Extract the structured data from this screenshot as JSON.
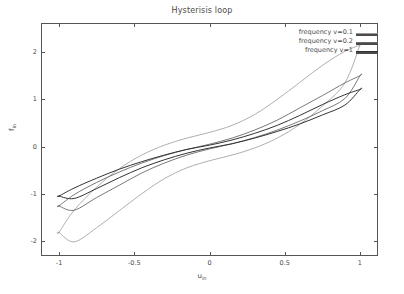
{
  "chart_data": {
    "type": "line",
    "title": "Hysterisis loop",
    "xlabel": "u",
    "xlabel_sub": "in",
    "ylabel": "f",
    "ylabel_sub": "in",
    "xlim": [
      -1.12,
      1.12
    ],
    "ylim": [
      -2.32,
      2.62
    ],
    "xticks": [
      -1,
      -0.5,
      0,
      0.5,
      1
    ],
    "xtick_labels": [
      "-1",
      "-0.5",
      "0",
      "0.5",
      "1"
    ],
    "yticks": [
      -2,
      -1,
      0,
      1,
      2
    ],
    "ytick_labels": [
      "-2",
      "-1",
      "0",
      "1",
      "2"
    ],
    "grid": false,
    "legend_position": "top-right-inside",
    "series": [
      {
        "name": "frequency v=0.1",
        "color": "#9a9a9a",
        "width": 0.8,
        "loop_amplitude": 2.15,
        "loop_amplitude_neg": -1.82,
        "loop_width": 0.52,
        "x": [
          -1.0,
          -0.9,
          -0.75,
          -0.6,
          -0.45,
          -0.3,
          -0.15,
          0.0,
          0.15,
          0.3,
          0.45,
          0.6,
          0.75,
          0.9,
          1.0
        ],
        "y_upper": [
          -1.82,
          -1.35,
          -0.86,
          -0.47,
          -0.18,
          0.03,
          0.18,
          0.3,
          0.45,
          0.68,
          1.0,
          1.36,
          1.72,
          2.02,
          2.15
        ],
        "y_lower": [
          -1.82,
          -2.02,
          -1.72,
          -1.36,
          -1.0,
          -0.68,
          -0.45,
          -0.3,
          -0.18,
          -0.03,
          0.18,
          0.47,
          0.86,
          1.35,
          2.15
        ]
      },
      {
        "name": "frequency v=0.2",
        "color": "#6a6a6a",
        "width": 0.9,
        "loop_amplitude": 1.5,
        "loop_amplitude_neg": -1.26,
        "loop_width": 0.2,
        "x": [
          -1.0,
          -0.9,
          -0.75,
          -0.6,
          -0.45,
          -0.3,
          -0.15,
          0.0,
          0.15,
          0.3,
          0.45,
          0.6,
          0.75,
          0.9,
          1.0
        ],
        "y_upper": [
          -1.26,
          -1.02,
          -0.76,
          -0.54,
          -0.35,
          -0.19,
          -0.06,
          0.05,
          0.18,
          0.35,
          0.56,
          0.82,
          1.08,
          1.35,
          1.5
        ],
        "y_lower": [
          -1.26,
          -1.35,
          -1.08,
          -0.82,
          -0.56,
          -0.35,
          -0.18,
          -0.05,
          0.06,
          0.19,
          0.35,
          0.54,
          0.76,
          1.02,
          1.5
        ]
      },
      {
        "name": "frequency v=1",
        "color": "#333333",
        "width": 1.0,
        "loop_amplitude": 1.21,
        "loop_amplitude_neg": -1.05,
        "loop_width": 0.1,
        "x": [
          -1.0,
          -0.9,
          -0.75,
          -0.6,
          -0.45,
          -0.3,
          -0.15,
          0.0,
          0.15,
          0.3,
          0.45,
          0.6,
          0.75,
          0.9,
          1.0
        ],
        "y_upper": [
          -1.05,
          -0.88,
          -0.67,
          -0.48,
          -0.32,
          -0.18,
          -0.06,
          0.03,
          0.14,
          0.28,
          0.45,
          0.66,
          0.89,
          1.1,
          1.21
        ],
        "y_lower": [
          -1.05,
          -1.1,
          -0.89,
          -0.66,
          -0.45,
          -0.28,
          -0.14,
          -0.03,
          0.06,
          0.18,
          0.32,
          0.48,
          0.67,
          0.88,
          1.21
        ]
      }
    ]
  },
  "plot_frame": {
    "left": 41,
    "right": 378,
    "top": 23,
    "bottom": 256,
    "border_color": "#555555"
  }
}
